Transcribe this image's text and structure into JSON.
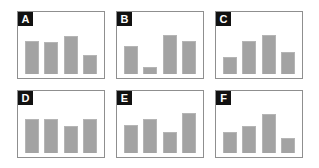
{
  "figure": {
    "background_color": "#ffffff",
    "panel_border_color": "#8f8f8f",
    "panel_label_background": "#111111",
    "panel_label_color": "#ffffff",
    "bar_color": "#a3a3a3",
    "bar_edge_color": "#b5b5b5",
    "rows": 2,
    "columns": 3,
    "panel_count": 6
  },
  "chart_data": [
    {
      "type": "bar",
      "title": "A",
      "panel_label": "A",
      "categories": [
        "1",
        "2",
        "3",
        "4"
      ],
      "values": [
        72,
        70,
        82,
        42
      ],
      "xlabel": "",
      "ylabel": "",
      "ylim": [
        0,
        100
      ],
      "grid": false,
      "legend": false
    },
    {
      "type": "bar",
      "title": "B",
      "panel_label": "B",
      "categories": [
        "1",
        "2",
        "3",
        "4"
      ],
      "values": [
        60,
        15,
        85,
        72
      ],
      "xlabel": "",
      "ylabel": "",
      "ylim": [
        0,
        100
      ],
      "grid": false,
      "legend": false
    },
    {
      "type": "bar",
      "title": "C",
      "panel_label": "C",
      "categories": [
        "1",
        "2",
        "3",
        "4"
      ],
      "values": [
        38,
        72,
        85,
        47
      ],
      "xlabel": "",
      "ylabel": "",
      "ylim": [
        0,
        100
      ],
      "grid": false,
      "legend": false
    },
    {
      "type": "bar",
      "title": "D",
      "panel_label": "D",
      "categories": [
        "1",
        "2",
        "3",
        "4"
      ],
      "values": [
        75,
        74,
        58,
        73
      ],
      "xlabel": "",
      "ylabel": "",
      "ylim": [
        0,
        100
      ],
      "grid": false,
      "legend": false
    },
    {
      "type": "bar",
      "title": "E",
      "panel_label": "E",
      "categories": [
        "1",
        "2",
        "3",
        "4"
      ],
      "values": [
        60,
        73,
        45,
        88
      ],
      "xlabel": "",
      "ylabel": "",
      "ylim": [
        0,
        100
      ],
      "grid": false,
      "legend": false
    },
    {
      "type": "bar",
      "title": "F",
      "panel_label": "F",
      "categories": [
        "1",
        "2",
        "3",
        "4"
      ],
      "values": [
        45,
        58,
        85,
        32
      ],
      "xlabel": "",
      "ylabel": "",
      "ylim": [
        0,
        100
      ],
      "grid": false,
      "legend": false
    }
  ]
}
